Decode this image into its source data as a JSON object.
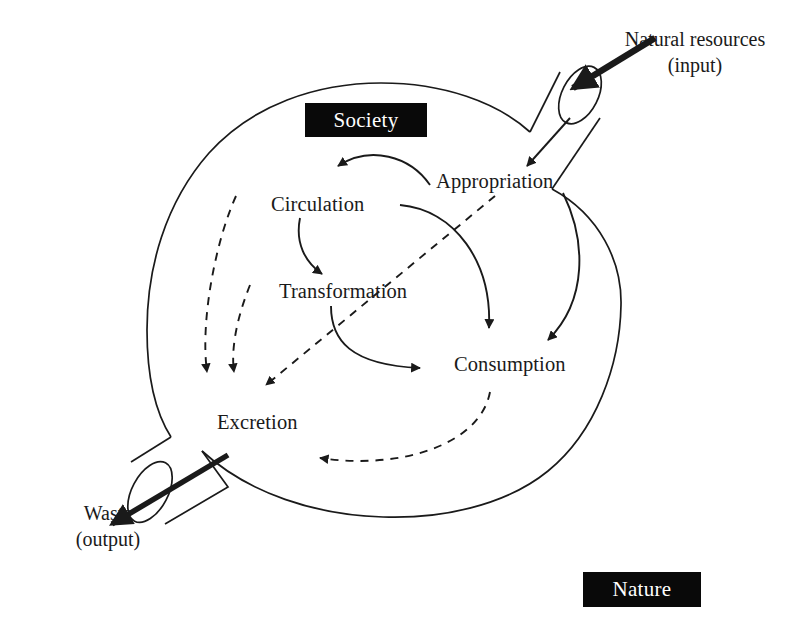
{
  "diagram": {
    "title_tags": {
      "society": "Society",
      "nature": "Nature"
    },
    "nodes": [
      {
        "id": "appropriation",
        "label": "Appropriation"
      },
      {
        "id": "circulation",
        "label": "Circulation"
      },
      {
        "id": "transformation",
        "label": "Transformation"
      },
      {
        "id": "consumption",
        "label": "Consumption"
      },
      {
        "id": "excretion",
        "label": "Excretion"
      }
    ],
    "io": {
      "input_line1": "Natural resources",
      "input_line2": "(input)",
      "output_line1": "Waste",
      "output_line2": "(output)"
    },
    "colors": {
      "stroke": "#1a1a1a",
      "tag_background": "#090909",
      "tag_text": "#ffffff",
      "page_background": "#ffffff"
    },
    "flows": {
      "solid": [
        {
          "from": "appropriation",
          "to": "circulation"
        },
        {
          "from": "circulation",
          "to": "transformation"
        },
        {
          "from": "transformation",
          "to": "consumption"
        },
        {
          "from": "appropriation",
          "to": "consumption"
        },
        {
          "from": "input-pipe",
          "to": "appropriation"
        },
        {
          "from": "input-pipe",
          "to": "consumption"
        }
      ],
      "dashed": [
        {
          "from": "circulation",
          "to": "excretion"
        },
        {
          "from": "transformation",
          "to": "excretion"
        },
        {
          "from": "appropriation",
          "to": "excretion"
        },
        {
          "from": "consumption",
          "to": "excretion"
        }
      ],
      "thick": [
        {
          "from": "natural-resources",
          "to": "input-pipe"
        },
        {
          "from": "excretion-pipe",
          "to": "waste"
        }
      ]
    }
  }
}
